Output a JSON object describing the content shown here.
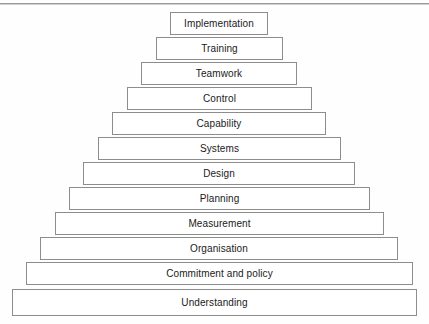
{
  "diagram": {
    "type": "stepped-pyramid",
    "orientation": "apex-top",
    "tier_count": 12,
    "center_x": 214,
    "colors": {
      "tier_fill": "#ffffff",
      "tier_border": "#8d8d8d",
      "label_text": "#1a1a1a",
      "page_background": "#fefefe",
      "top_rule": "#9a9a9a"
    },
    "geometry": {
      "top_y": 12,
      "bottom_y": 316,
      "tier_height": 23,
      "apex_left": 170,
      "apex_right": 268,
      "base_left": 12,
      "base_right": 416,
      "step_per_side": 14.4
    },
    "tiers": [
      {
        "level": 1,
        "label": "Implementation",
        "top": 12,
        "left": 170,
        "width": 98
      },
      {
        "level": 2,
        "label": "Training",
        "top": 37,
        "left": 156,
        "width": 127
      },
      {
        "level": 3,
        "label": "Teamwork",
        "top": 62,
        "left": 141,
        "width": 156
      },
      {
        "level": 4,
        "label": "Control",
        "top": 87,
        "left": 127,
        "width": 185
      },
      {
        "level": 5,
        "label": "Capability",
        "top": 112,
        "left": 112,
        "width": 214
      },
      {
        "level": 6,
        "label": "Systems",
        "top": 137,
        "left": 98,
        "width": 243
      },
      {
        "level": 7,
        "label": "Design",
        "top": 162,
        "left": 83,
        "width": 272
      },
      {
        "level": 8,
        "label": "Planning",
        "top": 187,
        "left": 69,
        "width": 301
      },
      {
        "level": 9,
        "label": "Measurement",
        "top": 212,
        "left": 55,
        "width": 329
      },
      {
        "level": 10,
        "label": "Organisation",
        "top": 237,
        "left": 40,
        "width": 358
      },
      {
        "level": 11,
        "label": "Commitment and policy",
        "top": 262,
        "left": 26,
        "width": 387
      },
      {
        "level": 12,
        "label": "Understanding",
        "top": 289,
        "left": 12,
        "width": 405
      }
    ]
  }
}
